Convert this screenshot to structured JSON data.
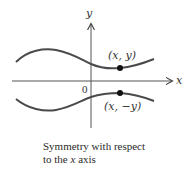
{
  "diagram": {
    "axes": {
      "x_label": "x",
      "y_label": "y",
      "origin_label": "0"
    },
    "points": [
      {
        "label": "(x, y)",
        "position": "above x axis"
      },
      {
        "label": "(x, −y)",
        "position": "below x axis"
      }
    ],
    "curves": [
      {
        "name": "upper-curve",
        "description": "wavy curve above the x axis"
      },
      {
        "name": "lower-curve",
        "description": "mirror image of the upper curve below the x axis"
      }
    ],
    "colors": {
      "stroke": "#4a4a4a",
      "point": "#111111",
      "text": "#333333"
    }
  },
  "caption": {
    "line1": "Symmetry with respect",
    "line2_prefix": "to the ",
    "line2_var": "x",
    "line2_suffix": " axis"
  }
}
